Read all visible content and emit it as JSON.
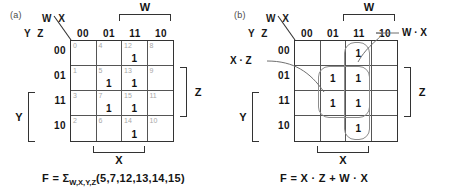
{
  "figure": {
    "panels": [
      {
        "tag": "(a)",
        "axis": {
          "col_var_label": "W X",
          "row_var_label": "Y Z",
          "col_headers": [
            "00",
            "01",
            "11",
            "10"
          ],
          "row_headers": [
            "00",
            "01",
            "11",
            "10"
          ]
        },
        "brackets": [
          {
            "name": "W",
            "label": "W",
            "side": "top",
            "covers": [
              "11",
              "10"
            ]
          },
          {
            "name": "Z",
            "label": "Z",
            "side": "right",
            "covers": [
              "01",
              "11"
            ]
          },
          {
            "name": "X",
            "label": "X",
            "side": "bottom",
            "covers": [
              "01",
              "11"
            ]
          },
          {
            "name": "Y",
            "label": "Y",
            "side": "left",
            "covers": [
              "11",
              "10"
            ]
          }
        ],
        "cells": [
          {
            "index": "0",
            "value": ""
          },
          {
            "index": "4",
            "value": ""
          },
          {
            "index": "12",
            "value": "1"
          },
          {
            "index": "8",
            "value": ""
          },
          {
            "index": "1",
            "value": ""
          },
          {
            "index": "5",
            "value": "1"
          },
          {
            "index": "13",
            "value": "1"
          },
          {
            "index": "9",
            "value": ""
          },
          {
            "index": "3",
            "value": ""
          },
          {
            "index": "7",
            "value": "1"
          },
          {
            "index": "15",
            "value": "1"
          },
          {
            "index": "11",
            "value": ""
          },
          {
            "index": "2",
            "value": ""
          },
          {
            "index": "6",
            "value": ""
          },
          {
            "index": "14",
            "value": "1"
          },
          {
            "index": "10",
            "value": ""
          }
        ],
        "equation_prefix": "F = Σ",
        "equation_sub": "W,X,Y,Z",
        "equation_suffix": "(5,7,12,13,14,15)"
      },
      {
        "tag": "(b)",
        "axis": {
          "col_var_label": "W X",
          "row_var_label": "Y Z",
          "col_headers": [
            "00",
            "01",
            "11",
            "10"
          ],
          "row_headers": [
            "00",
            "01",
            "11",
            "10"
          ]
        },
        "brackets": [
          {
            "name": "W",
            "label": "W",
            "side": "top",
            "covers": [
              "11",
              "10"
            ]
          },
          {
            "name": "Z",
            "label": "Z",
            "side": "right",
            "covers": [
              "01",
              "11"
            ]
          },
          {
            "name": "X",
            "label": "X",
            "side": "bottom",
            "covers": [
              "01",
              "11"
            ]
          },
          {
            "name": "Y",
            "label": "Y",
            "side": "left",
            "covers": [
              "11",
              "10"
            ]
          }
        ],
        "cells": [
          {
            "index": "",
            "value": ""
          },
          {
            "index": "",
            "value": ""
          },
          {
            "index": "",
            "value": "1"
          },
          {
            "index": "",
            "value": ""
          },
          {
            "index": "",
            "value": ""
          },
          {
            "index": "",
            "value": "1"
          },
          {
            "index": "",
            "value": "1"
          },
          {
            "index": "",
            "value": ""
          },
          {
            "index": "",
            "value": ""
          },
          {
            "index": "",
            "value": "1"
          },
          {
            "index": "",
            "value": "1"
          },
          {
            "index": "",
            "value": ""
          },
          {
            "index": "",
            "value": ""
          },
          {
            "index": "",
            "value": ""
          },
          {
            "index": "",
            "value": "1"
          },
          {
            "index": "",
            "value": ""
          }
        ],
        "groups": [
          {
            "name": "x-dot-z",
            "label": "X · Z",
            "cols": [
              "01",
              "11"
            ],
            "rows": [
              "01",
              "11"
            ]
          },
          {
            "name": "w-dot-x",
            "label": "W · X",
            "cols": [
              "11"
            ],
            "rows": [
              "00",
              "01",
              "11",
              "10"
            ]
          }
        ],
        "equation_prefix": "F = X · Z + W · X",
        "equation_sub": "",
        "equation_suffix": ""
      }
    ]
  },
  "chart_data": {
    "type": "table",
    "variables": [
      "W",
      "X",
      "Y",
      "Z"
    ],
    "column_headers": [
      "00",
      "01",
      "11",
      "10"
    ],
    "row_headers": [
      "00",
      "01",
      "11",
      "10"
    ],
    "column_variable": "W X",
    "row_variable": "Y Z",
    "minterms": [
      5,
      7,
      12,
      13,
      14,
      15
    ],
    "cell_indices": [
      [
        "0",
        "4",
        "12",
        "8"
      ],
      [
        "1",
        "5",
        "13",
        "9"
      ],
      [
        "3",
        "7",
        "15",
        "11"
      ],
      [
        "2",
        "6",
        "14",
        "10"
      ]
    ],
    "cell_values": [
      [
        "",
        "",
        "1",
        ""
      ],
      [
        "",
        "1",
        "1",
        ""
      ],
      [
        "",
        "1",
        "1",
        ""
      ],
      [
        "",
        "",
        "1",
        ""
      ]
    ],
    "groups": [
      {
        "term": "X · Z",
        "minterms": [
          5,
          7,
          13,
          15
        ]
      },
      {
        "term": "W · X",
        "minterms": [
          12,
          13,
          15,
          14
        ]
      }
    ],
    "canonical_form": "F = ΣW,X,Y,Z(5,7,12,13,14,15)",
    "simplified_form": "F = X · Z + W · X"
  }
}
